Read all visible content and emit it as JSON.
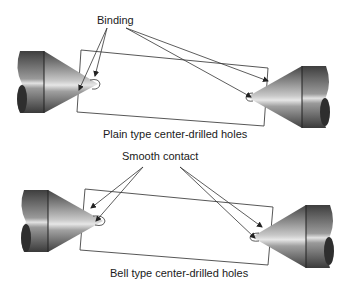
{
  "diagram": {
    "top": {
      "callout": "Binding",
      "caption": "Plain type center-drilled holes"
    },
    "bottom": {
      "callout": "Smooth contact",
      "caption": "Bell type center-drilled holes"
    }
  },
  "colors": {
    "line": "#3a3a3a",
    "metal_dark": "#4a4a4a",
    "metal_light": "#d8d8d8",
    "background": "#ffffff"
  }
}
